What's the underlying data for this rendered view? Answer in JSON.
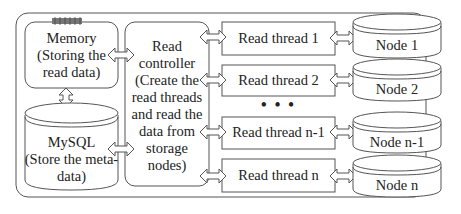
{
  "diagram": {
    "type": "architecture",
    "memory": {
      "title": "Memory",
      "desc": "(Storing the read data)",
      "line1": "Memory",
      "line2": "(Storing the",
      "line3": "read data)"
    },
    "mysql": {
      "title": "MySQL",
      "desc": "(Store the meta-data)",
      "line1": "MySQL",
      "line2": "(Store the meta-",
      "line3": "data)"
    },
    "controller": {
      "lines": [
        "Read",
        "controller",
        "(Create the",
        "read threads",
        "and read the",
        "data from",
        "storage",
        "nodes)"
      ]
    },
    "threads": [
      {
        "label": "Read thread 1"
      },
      {
        "label": "Read thread 2"
      },
      {
        "label": "Read thread n-1"
      },
      {
        "label": "Read thread n"
      }
    ],
    "ellipsis": "• • •",
    "nodes": [
      {
        "label": "Node 1"
      },
      {
        "label": "Node 2"
      },
      {
        "label": "Node n-1"
      },
      {
        "label": "Node n"
      }
    ],
    "connections": [
      [
        "memory",
        "controller"
      ],
      [
        "memory",
        "mysql"
      ],
      [
        "mysql",
        "controller"
      ],
      [
        "controller",
        "thread-1"
      ],
      [
        "controller",
        "thread-2"
      ],
      [
        "controller",
        "thread-n-1"
      ],
      [
        "controller",
        "thread-n"
      ],
      [
        "thread-1",
        "node-1"
      ],
      [
        "thread-2",
        "node-2"
      ],
      [
        "thread-n-1",
        "node-n-1"
      ],
      [
        "thread-n",
        "node-n"
      ]
    ],
    "colors": {
      "stroke": "#555555",
      "text": "#222222",
      "background": "#ffffff",
      "chip": "#777777"
    }
  }
}
